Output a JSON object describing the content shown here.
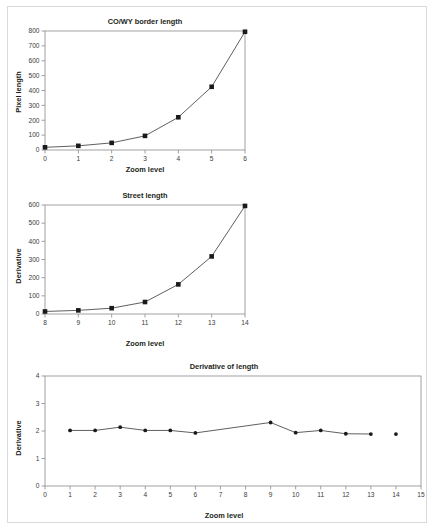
{
  "figure": {
    "background_color": "#ffffff",
    "border_color": "#d9d9d9",
    "axis_color": "#8a8a8a",
    "marker_color": "#1a1a1a",
    "line_color": "#4d4d4d"
  },
  "chart_data": [
    {
      "type": "line",
      "title": "CO/WY border length",
      "xlabel": "Zoom level",
      "ylabel": "Pixel length",
      "x": [
        0,
        1,
        2,
        3,
        4,
        5,
        6
      ],
      "values": [
        18,
        28,
        48,
        95,
        220,
        425,
        795
      ],
      "xlim": [
        0,
        6
      ],
      "ylim": [
        0,
        800
      ],
      "xticks": [
        0,
        1,
        2,
        3,
        4,
        5,
        6
      ],
      "yticks": [
        0,
        100,
        200,
        300,
        400,
        500,
        600,
        700,
        800
      ],
      "xticklabels": [
        "0",
        "1",
        "2",
        "3",
        "4",
        "5",
        "6"
      ],
      "yticklabels": [
        "0",
        "100",
        "200",
        "300",
        "400",
        "500",
        "600",
        "700",
        "800"
      ],
      "grid": false,
      "legend": null,
      "markers": "square"
    },
    {
      "type": "line",
      "title": "Street length",
      "xlabel": "Zoom level",
      "ylabel": "Derivative",
      "x": [
        8,
        9,
        10,
        11,
        12,
        13,
        14
      ],
      "values": [
        14,
        20,
        32,
        66,
        163,
        317,
        595
      ],
      "xlim": [
        8,
        14
      ],
      "ylim": [
        0,
        600
      ],
      "xticks": [
        8,
        9,
        10,
        11,
        12,
        13,
        14
      ],
      "yticks": [
        0,
        100,
        200,
        300,
        400,
        500,
        600
      ],
      "xticklabels": [
        "8",
        "9",
        "10",
        "11",
        "12",
        "13",
        "14"
      ],
      "yticklabels": [
        "0",
        "100",
        "200",
        "300",
        "400",
        "500",
        "600"
      ],
      "grid": false,
      "legend": null,
      "markers": "square"
    },
    {
      "type": "line",
      "title": "Derivative of length",
      "xlabel": "Zoom level",
      "ylabel": "Derivative",
      "x": [
        1,
        2,
        3,
        4,
        5,
        6,
        9,
        10,
        11,
        12,
        13
      ],
      "values": [
        2.02,
        2.02,
        2.14,
        2.02,
        2.02,
        1.93,
        2.31,
        1.94,
        2.02,
        1.9,
        1.89
      ],
      "detached_points": [
        {
          "x": 14,
          "y": 1.89
        }
      ],
      "xlim": [
        0,
        15
      ],
      "ylim": [
        0,
        4
      ],
      "xticks": [
        0,
        1,
        2,
        3,
        4,
        5,
        6,
        7,
        8,
        9,
        10,
        11,
        12,
        13,
        14,
        15
      ],
      "yticks": [
        0,
        1,
        2,
        3,
        4
      ],
      "xticklabels": [
        "0",
        "1",
        "2",
        "3",
        "4",
        "5",
        "6",
        "7",
        "8",
        "9",
        "10",
        "11",
        "12",
        "13",
        "14",
        "15"
      ],
      "yticklabels": [
        "0",
        "1",
        "2",
        "3",
        "4"
      ],
      "grid": false,
      "legend": null,
      "markers": "circle"
    }
  ]
}
